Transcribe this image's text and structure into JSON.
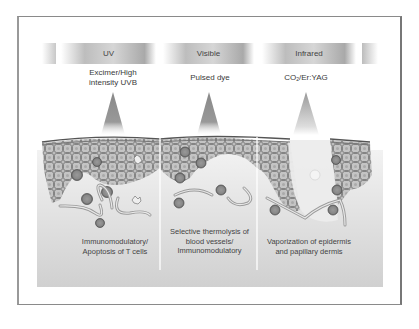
{
  "figure": {
    "spectrum_bands": [
      {
        "id": "uv",
        "label": "UV"
      },
      {
        "id": "visible",
        "label": "Visible"
      },
      {
        "id": "infrared",
        "label": "Infrared"
      }
    ],
    "lasers": [
      {
        "line1": "Excimer/High",
        "line2": "intensity UVB"
      },
      {
        "line1": "Pulsed dye",
        "line2": ""
      },
      {
        "prefix": "CO",
        "subscript": "2",
        "suffix": "/Er:YAG"
      }
    ],
    "effects": [
      {
        "line1": "Immunomodulatory/",
        "line2": "Apoptosis of T cells",
        "line3": ""
      },
      {
        "line1": "Selective thermolysis of",
        "line2": "blood vessels/",
        "line3": "Immunomodulatory"
      },
      {
        "line1": "Vaporization of epidermis",
        "line2": "and papillary dermis",
        "line3": ""
      }
    ],
    "colors": {
      "frame": "#8a8a8a",
      "band_dark": "#a9a9a9",
      "dermis": "#d9d9d9",
      "epidermis_cell": "#b8b8b8",
      "cell_outline": "#555555"
    }
  }
}
